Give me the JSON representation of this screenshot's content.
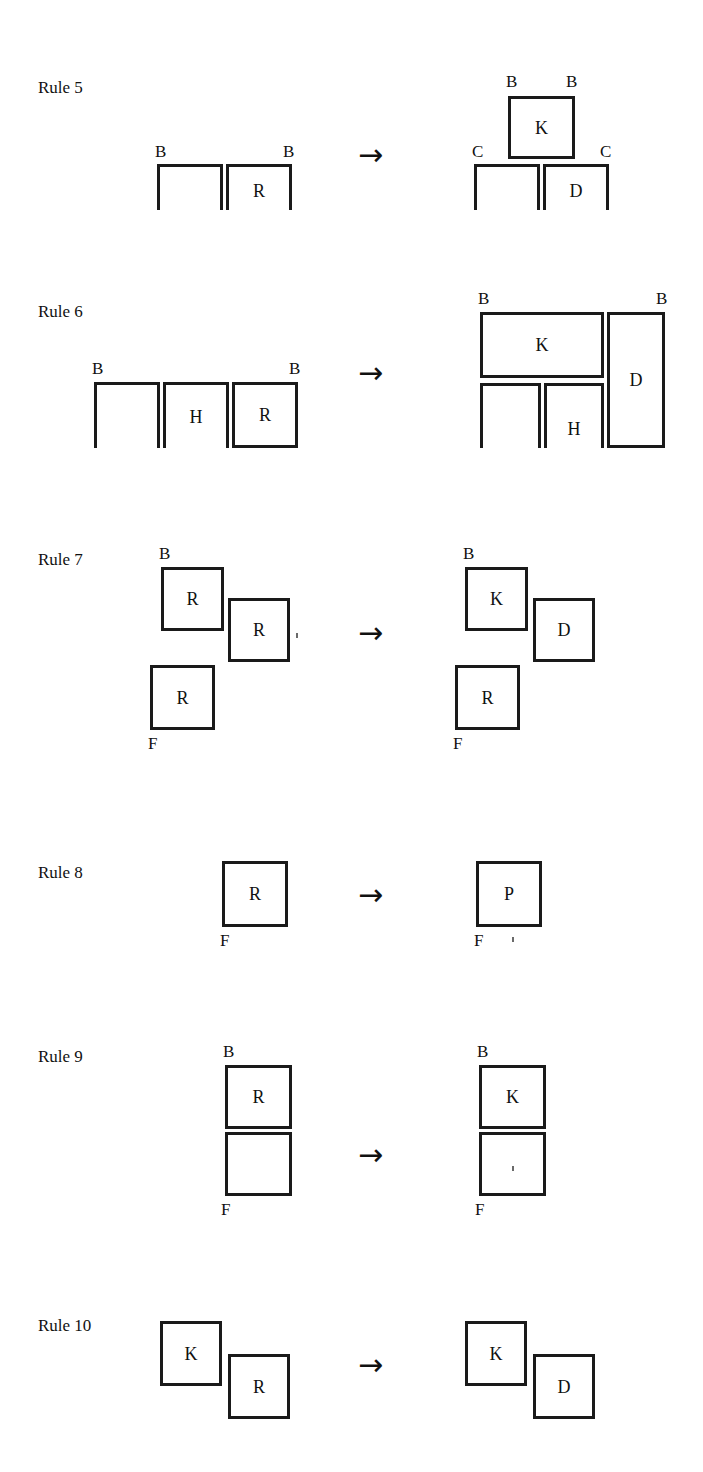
{
  "page": {
    "background": "#ffffff",
    "ink": "#1a1a1a",
    "width": 703,
    "height": 1472
  },
  "glyphs": {
    "arrow": "→"
  },
  "rules": [
    {
      "id": "rule-5",
      "label": "Rule 5",
      "label_x": 38,
      "label_y": 79,
      "arrow_x": 358,
      "arrow_y": 140,
      "lhs": {
        "shapes": [
          {
            "name": "open-box-left",
            "kind": "nshape",
            "x": 157,
            "y": 164,
            "w": 66,
            "h": 46,
            "letter": ""
          },
          {
            "name": "open-box-right",
            "kind": "nshape",
            "x": 226,
            "y": 164,
            "w": 66,
            "h": 46,
            "letter": "R",
            "letter_pos": "low"
          }
        ],
        "tags": [
          {
            "name": "tag-b-left",
            "text": "B",
            "x": 155,
            "y": 143
          },
          {
            "name": "tag-b-right",
            "text": "B",
            "x": 283,
            "y": 143
          }
        ]
      },
      "rhs": {
        "shapes": [
          {
            "name": "box-k",
            "kind": "box",
            "x": 508,
            "y": 96,
            "w": 67,
            "h": 63,
            "letter": "K",
            "letter_pos": "mid"
          },
          {
            "name": "open-box-left",
            "kind": "nshape",
            "x": 474,
            "y": 164,
            "w": 66,
            "h": 46,
            "letter": ""
          },
          {
            "name": "open-box-right",
            "kind": "nshape",
            "x": 543,
            "y": 164,
            "w": 66,
            "h": 46,
            "letter": "D",
            "letter_pos": "low"
          }
        ],
        "tags": [
          {
            "name": "tag-b-left",
            "text": "B",
            "x": 506,
            "y": 73
          },
          {
            "name": "tag-b-right",
            "text": "B",
            "x": 566,
            "y": 73
          },
          {
            "name": "tag-c-left",
            "text": "C",
            "x": 472,
            "y": 143
          },
          {
            "name": "tag-c-right",
            "text": "C",
            "x": 600,
            "y": 143
          }
        ]
      }
    },
    {
      "id": "rule-6",
      "label": "Rule 6",
      "label_x": 38,
      "label_y": 303,
      "arrow_x": 358,
      "arrow_y": 358,
      "lhs": {
        "shapes": [
          {
            "name": "open-box-1",
            "kind": "nshape",
            "x": 94,
            "y": 382,
            "w": 66,
            "h": 66,
            "letter": ""
          },
          {
            "name": "open-box-h",
            "kind": "nshape",
            "x": 163,
            "y": 382,
            "w": 66,
            "h": 66,
            "letter": "H",
            "letter_pos": "mid"
          },
          {
            "name": "box-r",
            "kind": "box",
            "x": 232,
            "y": 382,
            "w": 66,
            "h": 66,
            "letter": "R",
            "letter_pos": "mid"
          }
        ],
        "tags": [
          {
            "name": "tag-b-left",
            "text": "B",
            "x": 92,
            "y": 360
          },
          {
            "name": "tag-b-right",
            "text": "B",
            "x": 289,
            "y": 360
          }
        ]
      },
      "rhs": {
        "shapes": [
          {
            "name": "box-k",
            "kind": "box",
            "x": 480,
            "y": 312,
            "w": 124,
            "h": 66,
            "letter": "K",
            "letter_pos": "mid"
          },
          {
            "name": "open-box-1",
            "kind": "nshape",
            "x": 480,
            "y": 383,
            "w": 61,
            "h": 65,
            "letter": ""
          },
          {
            "name": "open-box-h",
            "kind": "nshape",
            "x": 544,
            "y": 383,
            "w": 60,
            "h": 65,
            "letter": "H",
            "letter_pos": "low"
          },
          {
            "name": "box-d",
            "kind": "box",
            "x": 607,
            "y": 312,
            "w": 58,
            "h": 136,
            "letter": "D",
            "letter_pos": "mid"
          }
        ],
        "tags": [
          {
            "name": "tag-b-left",
            "text": "B",
            "x": 478,
            "y": 290
          },
          {
            "name": "tag-b-right",
            "text": "B",
            "x": 656,
            "y": 290
          }
        ]
      }
    },
    {
      "id": "rule-7",
      "label": "Rule 7",
      "label_x": 38,
      "label_y": 551,
      "arrow_x": 358,
      "arrow_y": 618,
      "lhs": {
        "shapes": [
          {
            "name": "box-r-top",
            "kind": "box",
            "x": 161,
            "y": 567,
            "w": 63,
            "h": 64,
            "letter": "R",
            "letter_pos": "mid"
          },
          {
            "name": "box-r-mid",
            "kind": "box",
            "x": 228,
            "y": 598,
            "w": 62,
            "h": 64,
            "letter": "R",
            "letter_pos": "mid"
          },
          {
            "name": "box-r-bottom",
            "kind": "box",
            "x": 150,
            "y": 665,
            "w": 65,
            "h": 65,
            "letter": "R",
            "letter_pos": "mid"
          }
        ],
        "tags": [
          {
            "name": "tag-b",
            "text": "B",
            "x": 159,
            "y": 545
          },
          {
            "name": "tag-f",
            "text": "F",
            "x": 148,
            "y": 735
          }
        ]
      },
      "rhs": {
        "shapes": [
          {
            "name": "box-k",
            "kind": "box",
            "x": 465,
            "y": 567,
            "w": 63,
            "h": 64,
            "letter": "K",
            "letter_pos": "mid"
          },
          {
            "name": "box-d",
            "kind": "box",
            "x": 533,
            "y": 598,
            "w": 62,
            "h": 64,
            "letter": "D",
            "letter_pos": "mid"
          },
          {
            "name": "box-r",
            "kind": "box",
            "x": 455,
            "y": 665,
            "w": 65,
            "h": 65,
            "letter": "R",
            "letter_pos": "mid"
          }
        ],
        "tags": [
          {
            "name": "tag-b",
            "text": "B",
            "x": 463,
            "y": 545
          },
          {
            "name": "tag-f",
            "text": "F",
            "x": 453,
            "y": 735
          }
        ]
      }
    },
    {
      "id": "rule-8",
      "label": "Rule 8",
      "label_x": 38,
      "label_y": 864,
      "arrow_x": 358,
      "arrow_y": 880,
      "lhs": {
        "shapes": [
          {
            "name": "box-r",
            "kind": "box",
            "x": 222,
            "y": 861,
            "w": 66,
            "h": 66,
            "letter": "R",
            "letter_pos": "mid"
          }
        ],
        "tags": [
          {
            "name": "tag-f",
            "text": "F",
            "x": 220,
            "y": 932
          }
        ]
      },
      "rhs": {
        "shapes": [
          {
            "name": "box-p",
            "kind": "box",
            "x": 476,
            "y": 861,
            "w": 66,
            "h": 66,
            "letter": "P",
            "letter_pos": "mid"
          }
        ],
        "tags": [
          {
            "name": "tag-f",
            "text": "F",
            "x": 474,
            "y": 932
          }
        ]
      }
    },
    {
      "id": "rule-9",
      "label": "Rule 9",
      "label_x": 38,
      "label_y": 1048,
      "arrow_x": 358,
      "arrow_y": 1140,
      "lhs": {
        "shapes": [
          {
            "name": "box-r-top",
            "kind": "box",
            "x": 225,
            "y": 1065,
            "w": 67,
            "h": 64,
            "letter": "R",
            "letter_pos": "mid"
          },
          {
            "name": "box-empty-bottom",
            "kind": "box",
            "x": 225,
            "y": 1132,
            "w": 67,
            "h": 64,
            "letter": ""
          }
        ],
        "tags": [
          {
            "name": "tag-b",
            "text": "B",
            "x": 223,
            "y": 1043
          },
          {
            "name": "tag-f",
            "text": "F",
            "x": 221,
            "y": 1201
          }
        ]
      },
      "rhs": {
        "shapes": [
          {
            "name": "box-k-top",
            "kind": "box",
            "x": 479,
            "y": 1065,
            "w": 67,
            "h": 64,
            "letter": "K",
            "letter_pos": "mid"
          },
          {
            "name": "box-empty-bottom",
            "kind": "box",
            "x": 479,
            "y": 1132,
            "w": 67,
            "h": 64,
            "letter": ""
          }
        ],
        "tags": [
          {
            "name": "tag-b",
            "text": "B",
            "x": 477,
            "y": 1043
          },
          {
            "name": "tag-f",
            "text": "F",
            "x": 475,
            "y": 1201
          }
        ]
      }
    },
    {
      "id": "rule-10",
      "label": "Rule 10",
      "label_x": 38,
      "label_y": 1317,
      "arrow_x": 358,
      "arrow_y": 1350,
      "lhs": {
        "shapes": [
          {
            "name": "box-k",
            "kind": "box",
            "x": 160,
            "y": 1321,
            "w": 62,
            "h": 65,
            "letter": "K",
            "letter_pos": "mid"
          },
          {
            "name": "box-r",
            "kind": "box",
            "x": 228,
            "y": 1354,
            "w": 62,
            "h": 65,
            "letter": "R",
            "letter_pos": "mid"
          }
        ],
        "tags": []
      },
      "rhs": {
        "shapes": [
          {
            "name": "box-k",
            "kind": "box",
            "x": 465,
            "y": 1321,
            "w": 62,
            "h": 65,
            "letter": "K",
            "letter_pos": "mid"
          },
          {
            "name": "box-d",
            "kind": "box",
            "x": 533,
            "y": 1354,
            "w": 62,
            "h": 65,
            "letter": "D",
            "letter_pos": "mid"
          }
        ],
        "tags": []
      }
    }
  ],
  "specks": [
    {
      "name": "speck-rule7",
      "x": 296,
      "y": 633
    },
    {
      "name": "speck-rule8",
      "x": 512,
      "y": 937
    },
    {
      "name": "speck-rule9",
      "x": 512,
      "y": 1166
    }
  ]
}
